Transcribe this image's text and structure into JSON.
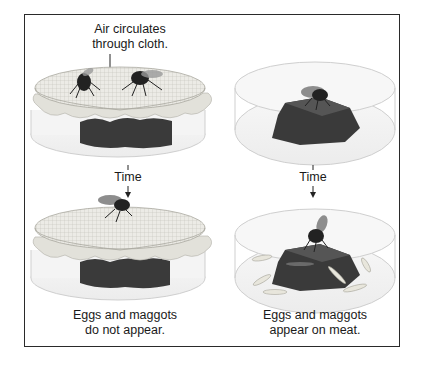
{
  "diagram": {
    "annotation_top": [
      "Air circulates",
      "through cloth."
    ],
    "time_label": "Time",
    "columns": [
      {
        "name": "covered-jar",
        "top_panel": "Jar covered with cloth, two flies on cloth, meat inside",
        "bottom_panel": "Jar covered with cloth, one fly on cloth, meat inside",
        "result": [
          "Eggs and maggots",
          "do not appear."
        ]
      },
      {
        "name": "open-jar",
        "top_panel": "Open jar with meat, fly on meat",
        "bottom_panel": "Open jar with meat, fly on meat, maggots around meat",
        "result": [
          "Eggs and maggots",
          "appear on meat."
        ]
      }
    ],
    "colors": {
      "border": "#2a2a2a",
      "meat": "#3a3a3a",
      "cloth": "#e6e6e2",
      "glass": "#d8d8d8",
      "fly": "#222222",
      "maggot": "#e8e6dc"
    }
  }
}
